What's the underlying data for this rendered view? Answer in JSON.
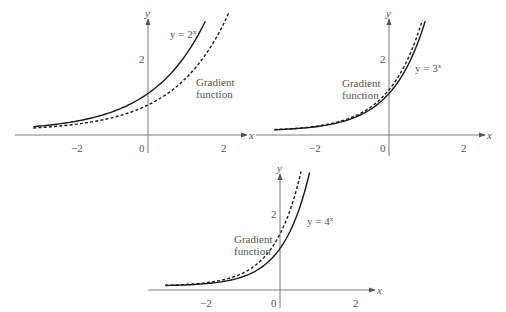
{
  "chart_data": [
    {
      "type": "line",
      "title": "",
      "xlabel": "x",
      "ylabel": "y",
      "xticks": [
        "-2",
        "0",
        "2"
      ],
      "yticks": [
        "2"
      ],
      "xlim": [
        -3.1,
        2.5
      ],
      "ylim": [
        0,
        3.1
      ],
      "grid": false,
      "series": [
        {
          "name": "y = 2^x",
          "style": "solid",
          "function": "2^x",
          "x_range": [
            -3.1,
            1.55
          ]
        },
        {
          "name": "Gradient function",
          "style": "dashed",
          "function": "ln(2)*2^x",
          "x_range": [
            -3.1,
            2.2
          ]
        }
      ],
      "annotations": [
        {
          "text": "y = 2",
          "superscript": "x",
          "near": "solid curve top"
        },
        {
          "text": "Gradient",
          "near": "dashed curve"
        },
        {
          "text": "function",
          "near": "dashed curve"
        }
      ]
    },
    {
      "type": "line",
      "title": "",
      "xlabel": "x",
      "ylabel": "y",
      "xticks": [
        "-2",
        "0",
        "2"
      ],
      "yticks": [
        "2"
      ],
      "xlim": [
        -3.1,
        2.5
      ],
      "ylim": [
        0,
        3.1
      ],
      "grid": false,
      "series": [
        {
          "name": "y = 3^x",
          "style": "solid",
          "function": "3^x",
          "x_range": [
            -3.1,
            0.98
          ]
        },
        {
          "name": "Gradient function",
          "style": "dashed",
          "function": "ln(3)*3^x",
          "x_range": [
            -3.1,
            0.9
          ]
        }
      ],
      "annotations": [
        {
          "text": "y = 3",
          "superscript": "x",
          "near": "solid curve"
        },
        {
          "text": "Gradient",
          "near": "curves left of y-axis"
        },
        {
          "text": "function",
          "near": "curves left of y-axis"
        }
      ]
    },
    {
      "type": "line",
      "title": "",
      "xlabel": "x",
      "ylabel": "y",
      "xticks": [
        "-2",
        "0",
        "2"
      ],
      "yticks": [
        "2"
      ],
      "xlim": [
        -3.1,
        2.5
      ],
      "ylim": [
        0,
        3.1
      ],
      "grid": false,
      "series": [
        {
          "name": "y = 4^x",
          "style": "solid",
          "function": "4^x",
          "x_range": [
            -3.1,
            0.8
          ]
        },
        {
          "name": "Gradient function",
          "style": "dashed",
          "function": "ln(4)*4^x",
          "x_range": [
            -3.1,
            0.57
          ]
        }
      ],
      "annotations": [
        {
          "text": "y = 4",
          "superscript": "x",
          "near": "solid curve"
        },
        {
          "text": "Gradient",
          "near": "curves left of y-axis"
        },
        {
          "text": "function",
          "near": "curves left of y-axis"
        }
      ]
    }
  ],
  "graphs": [
    {
      "axis_x_label": "x",
      "axis_y_label": "y",
      "tick_neg2": "−2",
      "tick_0": "0",
      "tick_2": "2",
      "ytick_2": "2",
      "curve_label": "y = 2",
      "curve_label_sup": "x",
      "gradient_label_1": "Gradient",
      "gradient_label_2": "function"
    },
    {
      "axis_x_label": "x",
      "axis_y_label": "y",
      "tick_neg2": "−2",
      "tick_0": "0",
      "tick_2": "2",
      "ytick_2": "2",
      "curve_label": "y = 3",
      "curve_label_sup": "x",
      "gradient_label_1": "Gradient",
      "gradient_label_2": "function"
    },
    {
      "axis_x_label": "x",
      "axis_y_label": "y",
      "tick_neg2": "−2",
      "tick_0": "0",
      "tick_2": "2",
      "ytick_2": "2",
      "curve_label": "y = 4",
      "curve_label_sup": "x",
      "gradient_label_1": "Gradient",
      "gradient_label_2": "function"
    }
  ]
}
